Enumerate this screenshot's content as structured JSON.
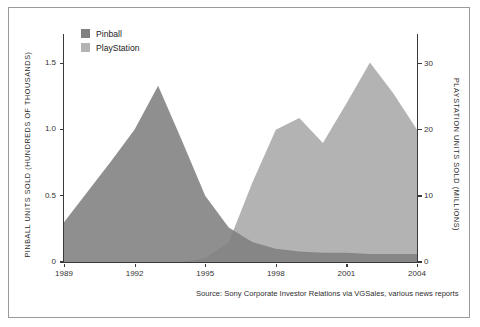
{
  "chart_data": {
    "type": "area",
    "title": "",
    "subtitle": "",
    "xlabel": "",
    "ylabel": "PINBALL UNITS SOLD (HUNDREDS OF THOUSANDS)",
    "y2label": "PLAYSTATION UNITS SOLD (MILLIONS)",
    "x": [
      1989,
      1990,
      1991,
      1992,
      1993,
      1994,
      1995,
      1996,
      1997,
      1998,
      1999,
      2000,
      2001,
      2002,
      2003,
      2004
    ],
    "xlim": [
      1989,
      2004
    ],
    "ylim": [
      0,
      1.72
    ],
    "y2lim": [
      0,
      34.5
    ],
    "xticks": [
      1989,
      1992,
      1995,
      1998,
      2001,
      2004
    ],
    "xticklabels": [
      "1989",
      "1992",
      "1995",
      "1998",
      "2001",
      "2004"
    ],
    "yticks": [
      0,
      0.5,
      1.0,
      1.5
    ],
    "yticklabels": [
      "0",
      "0.5",
      "1.0",
      "1.5"
    ],
    "y2ticks": [
      0,
      10,
      20,
      30
    ],
    "y2ticklabels": [
      "0",
      "10",
      "20",
      "30"
    ],
    "grid": false,
    "legend_position": "top-left",
    "series": [
      {
        "name": "Pinball",
        "axis": "left",
        "color": "#808080",
        "units": "hundreds of thousands",
        "values": [
          0.3,
          0.53,
          0.76,
          1.0,
          1.33,
          0.92,
          0.5,
          0.26,
          0.15,
          0.1,
          0.08,
          0.07,
          0.07,
          0.06,
          0.06,
          0.06
        ]
      },
      {
        "name": "PlayStation",
        "axis": "right",
        "color": "#b3b3b3",
        "units": "millions",
        "values": [
          0,
          0,
          0,
          0,
          0,
          0,
          0.6,
          3.0,
          12.0,
          20.0,
          21.8,
          18.0,
          24.0,
          30.2,
          25.5,
          20.0
        ]
      }
    ]
  },
  "legend": {
    "items": [
      {
        "label": "Pinball",
        "color": "#808080"
      },
      {
        "label": "PlayStation",
        "color": "#b3b3b3"
      }
    ]
  },
  "axes": {
    "left_title": "PINBALL UNITS SOLD (HUNDREDS OF THOUSANDS)",
    "right_title": "PLAYSTATION UNITS SOLD (MILLIONS)"
  },
  "source": {
    "text": "Source: Sony Corporate Investor Relations via VGSales, various news reports"
  },
  "colors": {
    "pinball": "#808080",
    "playstation": "#b3b3b3",
    "axis": "#3a3a3a",
    "frame": "#9a9a9a",
    "background": "#ffffff",
    "text": "#2b2b2b"
  }
}
